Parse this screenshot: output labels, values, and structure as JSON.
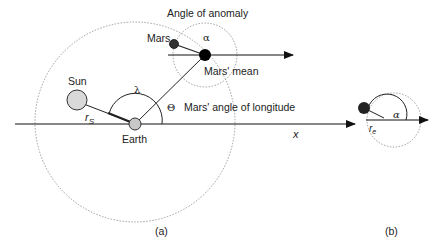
{
  "figure_a": {
    "caption": "(a)",
    "labels": {
      "angle_of_anomaly": "Angle of anomaly",
      "mars": "Mars",
      "alpha": "α",
      "mars_mean": "Mars' mean",
      "sun": "Sun",
      "lambda": "λ",
      "theta": "Θ",
      "mars_longitude": "Mars' angle of longitude",
      "r_s": "r",
      "r_s_sub": "S",
      "earth": "Earth",
      "x_axis": "x"
    }
  },
  "figure_b": {
    "caption": "(b)",
    "labels": {
      "alpha": "α",
      "r_e": "r",
      "r_e_sub": "e"
    }
  },
  "colors": {
    "line": "#222222",
    "dotted": "#888888",
    "sun_fill": "#d9d9d9",
    "earth_fill": "#c8c8c8",
    "mars_fill": "#333333",
    "mars_mean_fill": "#000000"
  }
}
